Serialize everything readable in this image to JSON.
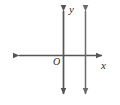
{
  "figure": {
    "background_color": "#ffffff",
    "stroke_color": "#555555",
    "label_color": "#2b2b2b",
    "width": 120,
    "height": 105,
    "labels": {
      "y_axis": "y",
      "x_axis": "x",
      "origin": "O"
    }
  },
  "chart_data": {
    "type": "line",
    "title": "",
    "xlabel": "x",
    "ylabel": "y",
    "xlim": [
      -5,
      3
    ],
    "ylim": [
      -4,
      4
    ],
    "grid": false,
    "legend": null,
    "axes": {
      "x_axis": {
        "label": "x",
        "orientation": "horizontal",
        "arrow_start": true,
        "arrow_end": true,
        "pixel_y": 55,
        "pixel_x_start": 13,
        "pixel_x_end": 108
      },
      "y_axis": {
        "label": "y",
        "orientation": "vertical",
        "arrow_start": true,
        "arrow_end": true,
        "pixel_x": 63,
        "pixel_y_start": 5,
        "pixel_y_end": 100
      }
    },
    "origin_label": "O",
    "series": [
      {
        "name": "vertical line",
        "kind": "vertical-line",
        "equation": "x = c",
        "pixel_x": 85,
        "pixel_y_start": 5,
        "pixel_y_end": 100,
        "arrow_start": true,
        "arrow_end": true,
        "color": "#6b6b6b"
      }
    ],
    "annotations": []
  }
}
